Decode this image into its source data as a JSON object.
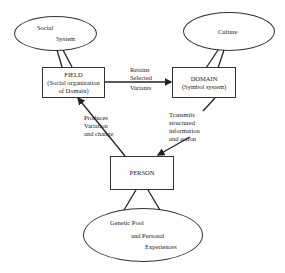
{
  "nodes": {
    "social_system": {
      "line1": "Social",
      "line2": "System"
    },
    "culture": {
      "label": "Culture"
    },
    "field": {
      "title": "FIELD",
      "sub1": "(Social organization",
      "sub2": "of Domain)"
    },
    "domain": {
      "title": "DOMAIN",
      "sub1": "(Symbol system)"
    },
    "person": {
      "title": "PERSON"
    },
    "genetic_pool": {
      "line1": "Genetic Pool",
      "line2": "and Personal",
      "line3": "Experiences"
    }
  },
  "edges": {
    "field_to_domain": {
      "line1": "Retains",
      "line2": "Selected",
      "line3": "Variants"
    },
    "person_to_field": {
      "line1": "Produces",
      "line2": "Variation",
      "line3": "and change"
    },
    "domain_to_person": {
      "line1": "Transmits",
      "line2": "structured",
      "line3": "information",
      "line4": "and action"
    }
  },
  "colors": {
    "stroke": "#333333",
    "background": "#ffffff"
  }
}
